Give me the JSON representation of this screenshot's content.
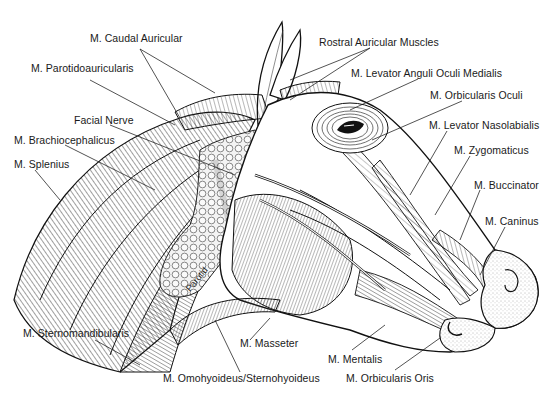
{
  "diagram": {
    "labels": [
      {
        "id": "caudal-auricular",
        "text": "M. Caudal Auricular",
        "x": 90,
        "y": 38
      },
      {
        "id": "parotidoauricularis",
        "text": "M. Parotidoauricularis",
        "x": 31,
        "y": 67
      },
      {
        "id": "facial-nerve",
        "text": "Facial Nerve",
        "x": 74,
        "y": 113
      },
      {
        "id": "brachiocephalicus",
        "text": "M. Brachiocephalicus",
        "x": 14,
        "y": 133
      },
      {
        "id": "splenius",
        "text": "M. Splenius",
        "x": 14,
        "y": 159
      },
      {
        "id": "rostral-auricular",
        "text": "Rostral Auricular Muscles",
        "x": 319,
        "y": 37
      },
      {
        "id": "levator-anguli-oculi",
        "text": "M. Levator Anguli Oculi Medialis",
        "x": 351,
        "y": 67
      },
      {
        "id": "orbicularis-oculi",
        "text": "M. Orbicularis Oculi",
        "x": 430,
        "y": 90
      },
      {
        "id": "levator-nasolabialis",
        "text": "M. Levator Nasolabialis",
        "x": 429,
        "y": 119
      },
      {
        "id": "zygomaticus",
        "text": "M. Zygomaticus",
        "x": 454,
        "y": 145
      },
      {
        "id": "buccinator",
        "text": "M. Buccinator",
        "x": 474,
        "y": 180
      },
      {
        "id": "caninus",
        "text": "M. Caninus",
        "x": 485,
        "y": 215
      },
      {
        "id": "sternomandibularis",
        "text": "M. Sternomandibularis",
        "x": 23,
        "y": 327
      },
      {
        "id": "masseter",
        "text": "M. Masseter",
        "x": 240,
        "y": 338
      },
      {
        "id": "mentalis",
        "text": "M. Mentalis",
        "x": 328,
        "y": 352
      },
      {
        "id": "omohyoideus",
        "text": "M. Omohyoideus/Sternohyoideus",
        "x": 163,
        "y": 372
      },
      {
        "id": "orbicularis-oris",
        "text": "M. Orbicularis Oris",
        "x": 346,
        "y": 372
      }
    ],
    "gland_labels": {
      "gland": "Gland",
      "parotid": "Parotid"
    },
    "colors": {
      "ink": "#1a1a1a",
      "background": "#ffffff",
      "shade": "#cfcfcf"
    }
  }
}
